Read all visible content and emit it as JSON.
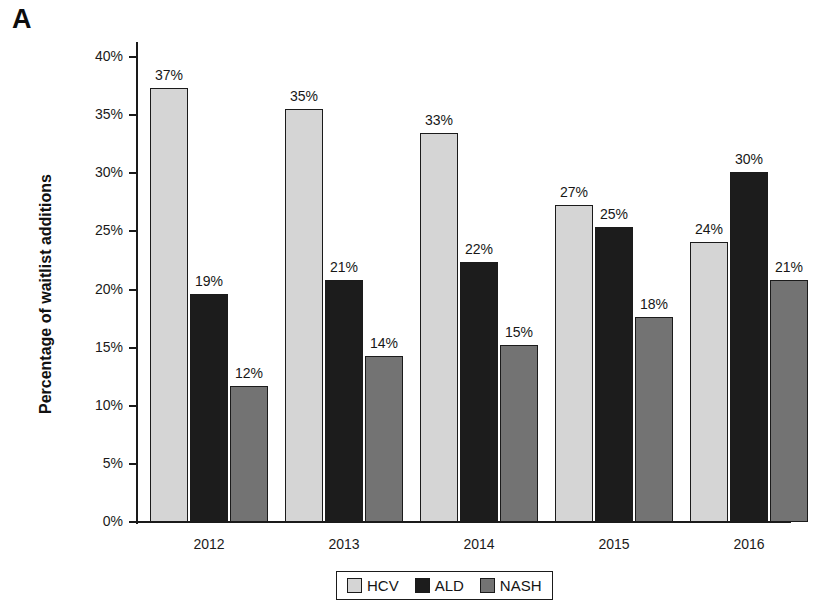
{
  "panel": {
    "letter": "A"
  },
  "chart_data": {
    "type": "bar",
    "title": "",
    "xlabel": "",
    "ylabel": "Percentage of waitlist additions",
    "ylim": [
      0,
      40
    ],
    "ytick_labels": [
      "0%",
      "5%",
      "10%",
      "15%",
      "20%",
      "25%",
      "30%",
      "35%",
      "40%"
    ],
    "ytick_values": [
      0,
      5,
      10,
      15,
      20,
      25,
      30,
      35,
      40
    ],
    "grid": false,
    "legend_position": "bottom-center",
    "categories": [
      "2012",
      "2013",
      "2014",
      "2015",
      "2016"
    ],
    "series": [
      {
        "name": "HCV",
        "color": "#d5d5d5",
        "values": [
          37.3,
          35.5,
          33.5,
          27.3,
          24.1
        ],
        "labels": [
          "37%",
          "35%",
          "33%",
          "27%",
          "24%"
        ]
      },
      {
        "name": "ALD",
        "color": "#1c1c1c",
        "values": [
          19.6,
          20.8,
          22.4,
          25.4,
          30.1
        ],
        "labels": [
          "19%",
          "21%",
          "22%",
          "25%",
          "30%"
        ]
      },
      {
        "name": "NASH",
        "color": "#737373",
        "values": [
          11.7,
          14.3,
          15.2,
          17.6,
          20.8
        ],
        "labels": [
          "12%",
          "14%",
          "15%",
          "18%",
          "21%"
        ]
      }
    ]
  },
  "legend": {
    "items": [
      {
        "label": "HCV"
      },
      {
        "label": "ALD"
      },
      {
        "label": "NASH"
      }
    ]
  },
  "colors": {
    "hcv": "#d5d5d5",
    "ald": "#1c1c1c",
    "nash": "#737373",
    "axis": "#1a1a1a",
    "background": "#ffffff"
  }
}
